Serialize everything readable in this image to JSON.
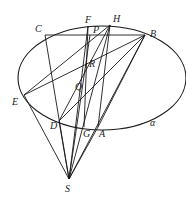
{
  "diagram": {
    "type": "geometry",
    "plane_label": "α",
    "ellipse": {
      "cx": 102,
      "cy": 78,
      "rx": 84,
      "ry": 52
    },
    "points": {
      "C": {
        "x": 45,
        "y": 35,
        "label": "C"
      },
      "F": {
        "x": 88,
        "y": 26,
        "label": "F"
      },
      "P": {
        "x": 90,
        "y": 35,
        "label": "P"
      },
      "H": {
        "x": 110,
        "y": 25,
        "label": "H"
      },
      "B": {
        "x": 145,
        "y": 35,
        "label": "B"
      },
      "R": {
        "x": 92,
        "y": 61,
        "label": "R"
      },
      "E": {
        "x": 24,
        "y": 95,
        "label": "E"
      },
      "Q": {
        "x": 85,
        "y": 92,
        "label": "Q"
      },
      "D": {
        "x": 59,
        "y": 121,
        "label": "D"
      },
      "G": {
        "x": 84,
        "y": 127,
        "label": "G"
      },
      "A": {
        "x": 98,
        "y": 127,
        "label": "A"
      },
      "S": {
        "x": 69,
        "y": 179,
        "label": "S"
      }
    },
    "segments": [
      [
        "C",
        "B"
      ],
      [
        "C",
        "S"
      ],
      [
        "E",
        "B"
      ],
      [
        "E",
        "H"
      ],
      [
        "E",
        "S"
      ],
      [
        "D",
        "B"
      ],
      [
        "D",
        "H"
      ],
      [
        "F",
        "G"
      ],
      [
        "F",
        "S"
      ],
      [
        "H",
        "S"
      ],
      [
        "H",
        "A"
      ],
      [
        "B",
        "S"
      ],
      [
        "B",
        "A"
      ],
      [
        "P",
        "S"
      ],
      [
        "D",
        "S"
      ],
      [
        "A",
        "S"
      ]
    ]
  }
}
